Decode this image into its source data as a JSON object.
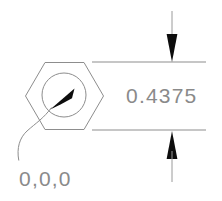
{
  "drawing": {
    "title": "Hex feature depth dimension",
    "background_color": "#ffffff",
    "line_color": "#8d8d8d",
    "arrow_color": "#0d0d0d",
    "text_color": "#8a8a8a"
  },
  "dimension": {
    "value": "0.4375",
    "units_implied": "inch",
    "type": "linear-vertical",
    "arrow_style": "filled-closed",
    "arrow_direction_top": "down",
    "arrow_direction_bottom": "up",
    "extension_line_top_y": 62,
    "extension_line_bottom_y": 130,
    "measured_span": 68
  },
  "origin_marker": {
    "label": "0,0,0",
    "leader_style": "curved-spline",
    "points_to": "hex-center-circle"
  },
  "geometry": {
    "hexagon": {
      "name": "hex-profile",
      "center_x": 64,
      "center_y": 96,
      "circumradius": 39,
      "orientation": "flat-top"
    },
    "circle": {
      "name": "bore-circle",
      "center_x": 64,
      "center_y": 95,
      "radius": 22
    }
  }
}
